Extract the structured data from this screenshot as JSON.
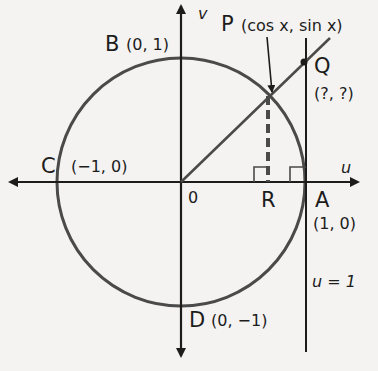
{
  "diagram": {
    "axes": {
      "horizontal_label": "u",
      "vertical_label": "v",
      "origin_label": "0"
    },
    "points": {
      "P": {
        "name": "P",
        "coords": "(cos x, sin x)"
      },
      "Q": {
        "name": "Q",
        "coords": "(?, ?)"
      },
      "B": {
        "name": "B",
        "coords": "(0, 1)"
      },
      "C": {
        "name": "C",
        "coords": "(−1, 0)"
      },
      "D": {
        "name": "D",
        "coords": "(0, −1)"
      },
      "A": {
        "name": "A",
        "coords": "(1, 0)"
      },
      "R": {
        "name": "R"
      }
    },
    "line_label": "u = 1",
    "colors": {
      "ink": "#1c1c1c",
      "circle": "#4a4a4a",
      "background": "#f4f3f1"
    }
  }
}
